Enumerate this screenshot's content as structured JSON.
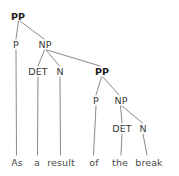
{
  "figure": {
    "kind": "syntax-parse-tree",
    "sentence": "As a result of the break",
    "line_color": "#8a8a8a",
    "label_color": "#3a3a3a",
    "bold_label_color": "#1b1b1b",
    "background_color": "#ffffff"
  },
  "nodes": {
    "root_pp": {
      "label": "PP",
      "x": 18,
      "y": 17,
      "bold": true
    },
    "p1": {
      "label": "P",
      "x": 16,
      "y": 45,
      "bold": false
    },
    "np1": {
      "label": "NP",
      "x": 45,
      "y": 45,
      "bold": false
    },
    "det1": {
      "label": "DET",
      "x": 38,
      "y": 72,
      "bold": false
    },
    "n1": {
      "label": "N",
      "x": 60,
      "y": 72,
      "bold": false
    },
    "pp2": {
      "label": "PP",
      "x": 102,
      "y": 72,
      "bold": true
    },
    "p2": {
      "label": "P",
      "x": 96,
      "y": 101,
      "bold": false
    },
    "np2": {
      "label": "NP",
      "x": 121,
      "y": 101,
      "bold": false
    },
    "det2": {
      "label": "DET",
      "x": 122,
      "y": 129,
      "bold": false
    },
    "n2": {
      "label": "N",
      "x": 143,
      "y": 129,
      "bold": false
    }
  },
  "leaves": [
    {
      "word": "As",
      "x": 17,
      "y": 163
    },
    {
      "word": "a",
      "x": 37,
      "y": 163
    },
    {
      "word": "result",
      "x": 61,
      "y": 163
    },
    {
      "word": "of",
      "x": 94,
      "y": 163
    },
    {
      "word": "the",
      "x": 120,
      "y": 163
    },
    {
      "word": "break",
      "x": 149,
      "y": 163
    }
  ],
  "edges": [
    {
      "from": "root_pp",
      "to": "p1"
    },
    {
      "from": "root_pp",
      "to": "np1"
    },
    {
      "from": "np1",
      "to": "det1"
    },
    {
      "from": "np1",
      "to": "n1"
    },
    {
      "from": "np1",
      "to": "pp2"
    },
    {
      "from": "pp2",
      "to": "p2"
    },
    {
      "from": "pp2",
      "to": "np2"
    },
    {
      "from": "np2",
      "to": "det2"
    },
    {
      "from": "np2",
      "to": "n2"
    },
    {
      "from": "p1",
      "to": "leaf-as"
    },
    {
      "from": "det1",
      "to": "leaf-a"
    },
    {
      "from": "n1",
      "to": "leaf-result"
    },
    {
      "from": "p2",
      "to": "leaf-of"
    },
    {
      "from": "det2",
      "to": "leaf-the"
    },
    {
      "from": "n2",
      "to": "leaf-break"
    }
  ]
}
